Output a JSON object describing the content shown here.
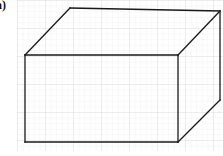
{
  "figure": {
    "label": "a)",
    "caption": "",
    "width": 223,
    "height": 156,
    "background_color": "#ffffff"
  },
  "grid": {
    "name": "graph-paper",
    "origin_x": 17,
    "origin_y": 0,
    "width": 206,
    "height": 151,
    "cell_size": 5.6,
    "major_every": 5,
    "minor_color": "#ebebee",
    "major_color": "#dcdce2",
    "minor_width": 0.6,
    "major_width": 0.8
  },
  "shape": {
    "name": "cuboid",
    "type": "rectangular-prism",
    "projection": "oblique",
    "stroke_color": "#1a1a1a",
    "stroke_width": 1.3,
    "fill": "none",
    "depth_offset_x": 42,
    "depth_offset_y": -44,
    "vertices": {
      "front_top_left": [
        25,
        55
      ],
      "front_top_right": [
        178,
        55
      ],
      "front_bottom_right": [
        178,
        142
      ],
      "front_bottom_left": [
        25,
        142
      ],
      "back_top_left": [
        70,
        8
      ],
      "back_top_right": [
        220,
        11
      ],
      "back_bottom_right": [
        220,
        100
      ],
      "back_bottom_left": [
        67,
        100
      ]
    },
    "visible_edges": [
      {
        "name": "front-top",
        "from": [
          25,
          55
        ],
        "to": [
          178,
          55
        ]
      },
      {
        "name": "front-right",
        "from": [
          178,
          55
        ],
        "to": [
          178,
          142
        ]
      },
      {
        "name": "front-bottom",
        "from": [
          178,
          142
        ],
        "to": [
          25,
          142
        ]
      },
      {
        "name": "front-left",
        "from": [
          25,
          142
        ],
        "to": [
          25,
          55
        ]
      },
      {
        "name": "top-left-depth",
        "from": [
          25,
          55
        ],
        "to": [
          70,
          8
        ]
      },
      {
        "name": "back-top",
        "from": [
          70,
          8
        ],
        "to": [
          220,
          11
        ]
      },
      {
        "name": "top-right-depth",
        "from": [
          220,
          11
        ],
        "to": [
          178,
          55
        ]
      },
      {
        "name": "back-right",
        "from": [
          220,
          11
        ],
        "to": [
          220,
          100
        ]
      },
      {
        "name": "bottom-right-depth",
        "from": [
          220,
          100
        ],
        "to": [
          178,
          142
        ]
      }
    ],
    "hidden_edges": []
  }
}
